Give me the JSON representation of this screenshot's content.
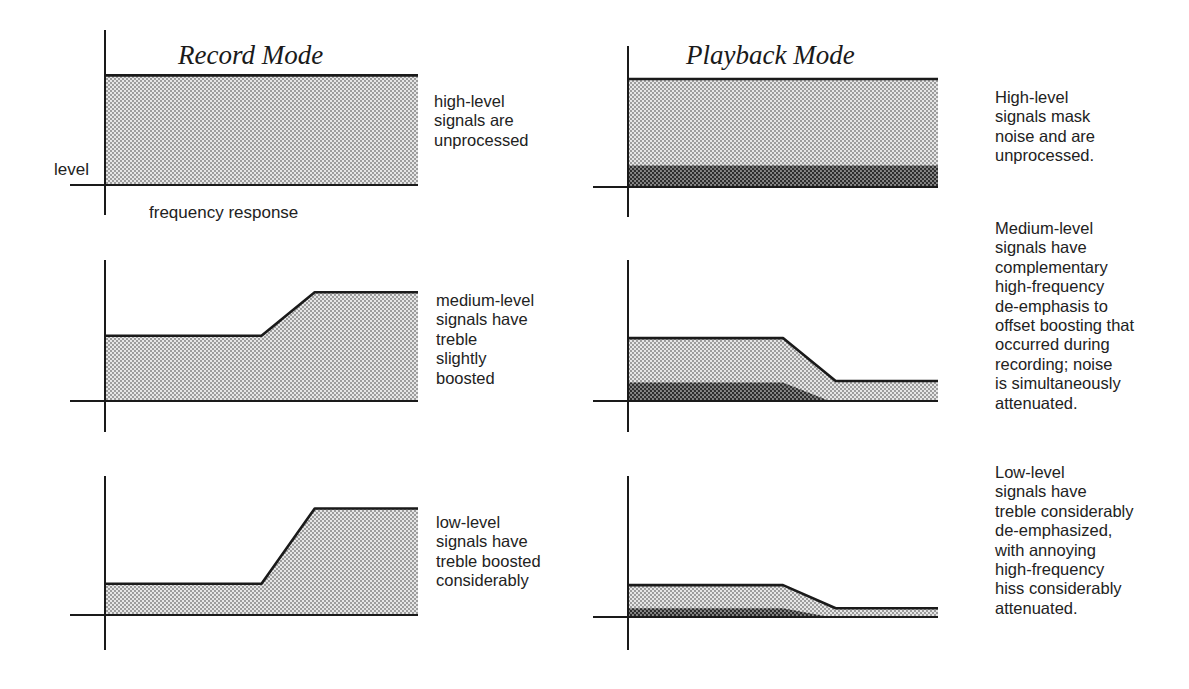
{
  "titles": {
    "record": "Record Mode",
    "playback": "Playback Mode"
  },
  "axis_labels": {
    "y": "level",
    "x": "frequency response"
  },
  "captions": {
    "record_high": "high-level\nsignals are\nunprocessed",
    "record_medium": "medium-level\nsignals have\ntreble\nslightly\nboosted",
    "record_low": "low-level\nsignals have\ntreble boosted\nconsiderably",
    "playback_high": "High-level\nsignals mask\nnoise and are\nunprocessed.",
    "playback_medium": "Medium-level\nsignals have\ncomplementary\nhigh-frequency\nde-emphasis to\noffset boosting that\noccurred during\nrecording; noise\nis simultaneously\nattenuated.",
    "playback_low": "Low-level\nsignals have\ntreble considerably\nde-emphasized,\nwith annoying\nhigh-frequency\nhiss considerably\nattenuated."
  },
  "colors": {
    "ink": "#1a1a1a",
    "signal_fill": "#c8c8c8",
    "noise_fill": "#6e6e6e",
    "background": "#ffffff"
  },
  "chart_data": [
    {
      "type": "area",
      "title": "Record Mode — high-level",
      "xlabel": "frequency response",
      "ylabel": "level",
      "signal": [
        [
          0,
          0.8
        ],
        [
          1,
          0.8
        ]
      ],
      "noise": null,
      "note": "flat, unprocessed"
    },
    {
      "type": "area",
      "title": "Record Mode — medium-level",
      "signal": [
        [
          0,
          0.45
        ],
        [
          0.5,
          0.45
        ],
        [
          0.67,
          0.75
        ],
        [
          1,
          0.75
        ]
      ],
      "noise": null,
      "note": "treble slightly boosted"
    },
    {
      "type": "area",
      "title": "Record Mode — low-level",
      "signal": [
        [
          0,
          0.22
        ],
        [
          0.5,
          0.22
        ],
        [
          0.67,
          0.75
        ],
        [
          1,
          0.75
        ]
      ],
      "noise": null,
      "note": "treble boosted considerably"
    },
    {
      "type": "area",
      "title": "Playback Mode — high-level",
      "signal": [
        [
          0,
          0.8
        ],
        [
          1,
          0.8
        ]
      ],
      "noise": [
        [
          0,
          0.16
        ],
        [
          1,
          0.16
        ]
      ],
      "note": "signals mask noise, unprocessed"
    },
    {
      "type": "area",
      "title": "Playback Mode — medium-level",
      "signal": [
        [
          0,
          0.44
        ],
        [
          0.5,
          0.44
        ],
        [
          0.67,
          0.14
        ],
        [
          1,
          0.14
        ]
      ],
      "noise": [
        [
          0,
          0.13
        ],
        [
          0.5,
          0.13
        ],
        [
          0.65,
          0.0
        ],
        [
          1,
          0.0
        ]
      ],
      "note": "complementary HF de-emphasis; noise attenuated"
    },
    {
      "type": "area",
      "title": "Playback Mode — low-level",
      "signal": [
        [
          0,
          0.22
        ],
        [
          0.5,
          0.22
        ],
        [
          0.67,
          0.06
        ],
        [
          1,
          0.06
        ]
      ],
      "noise": [
        [
          0,
          0.06
        ],
        [
          0.5,
          0.06
        ],
        [
          0.65,
          0.0
        ],
        [
          1,
          0.0
        ]
      ],
      "note": "treble considerably de-emphasized; hiss attenuated"
    }
  ],
  "panels": [
    {
      "id": "rec-high",
      "x0": 105,
      "x1": 418,
      "base": 185,
      "top_axis": 30,
      "bottom_axis": 215,
      "scale": 137,
      "chart": 0
    },
    {
      "id": "rec-med",
      "x0": 105,
      "x1": 418,
      "base": 401,
      "top_axis": 260,
      "bottom_axis": 432,
      "scale": 145,
      "chart": 1
    },
    {
      "id": "rec-low",
      "x0": 105,
      "x1": 418,
      "base": 615,
      "top_axis": 476,
      "bottom_axis": 650,
      "scale": 142,
      "chart": 2
    },
    {
      "id": "pb-high",
      "x0": 628,
      "x1": 938,
      "base": 187,
      "top_axis": 46,
      "bottom_axis": 217,
      "scale": 135,
      "chart": 3
    },
    {
      "id": "pb-med",
      "x0": 628,
      "x1": 938,
      "base": 401,
      "top_axis": 260,
      "bottom_axis": 432,
      "scale": 143,
      "chart": 4
    },
    {
      "id": "pb-low",
      "x0": 628,
      "x1": 938,
      "base": 617,
      "top_axis": 476,
      "bottom_axis": 650,
      "scale": 145,
      "chart": 5
    }
  ]
}
